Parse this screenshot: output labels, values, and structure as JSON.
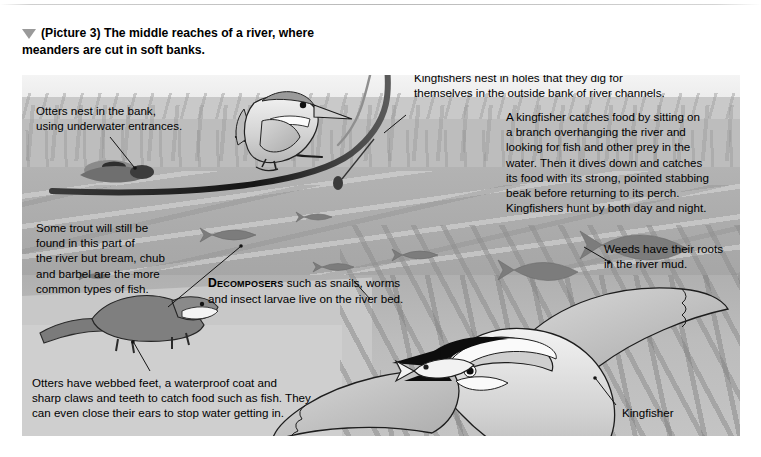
{
  "figure": {
    "caption": "(Picture 3) The middle reaches of a river, where meanders are cut in soft banks.",
    "caption_marker": "triangle-down-marker"
  },
  "annotations": [
    {
      "id": "otters-nest",
      "text": "Otters nest in the bank, using underwater entrances.",
      "lines": [
        "Otters nest in the bank,",
        "using underwater entrances."
      ]
    },
    {
      "id": "kingfishers-nest",
      "text": "Kingfishers nest in holes that they dig for themselves in the outside bank of river channels.",
      "lines": [
        "Kingfishers nest in holes that they dig for",
        "themselves in the outside bank of river channels."
      ]
    },
    {
      "id": "kingfisher-feeding",
      "text": "A kingfisher catches food by sitting on a branch overhanging the river and looking for fish and other prey in the water. Then it dives down and catches its food with its strong, pointed stabbing beak before returning to its perch. Kingfishers hunt by both day and night.",
      "lines": [
        "A kingfisher catches food by sitting on",
        "a branch overhanging the river and",
        "looking for fish and other prey in the",
        "water. Then it dives down and catches",
        "its food with its strong, pointed stabbing",
        "beak before returning to its perch.",
        "Kingfishers hunt by both day and night."
      ]
    },
    {
      "id": "fish-types",
      "text": "Some trout will still be found in this part of the river but bream, chub and barbel are the more common types of fish.",
      "lines": [
        "Some trout will still be",
        "found in this part of",
        "the river but bream, chub",
        "and barbel are the more",
        "common types of fish."
      ]
    },
    {
      "id": "decomposers",
      "lead_word": "Decomposers",
      "text": "Decomposers such as snails, worms and insect larvae live on the river bed.",
      "line1_rest": " such as snails, worms",
      "line2": "and insect larvae live on the river bed."
    },
    {
      "id": "weeds",
      "text": "Weeds have their roots in the river mud.",
      "lines": [
        "Weeds have their roots",
        "in the river mud."
      ]
    },
    {
      "id": "otter-features",
      "text": "Otters have webbed feet, a waterproof coat and sharp claws and teeth to catch food such as fish. They can even close their ears to stop water getting in.",
      "lines": [
        "Otters have webbed feet, a waterproof coat and",
        "sharp claws and teeth to catch food such as fish. They",
        "can even close their ears to stop water getting in."
      ]
    }
  ],
  "labels": [
    {
      "id": "kingfisher-label",
      "text": "Kingfisher"
    }
  ],
  "scene": {
    "elements": [
      "perched-kingfisher",
      "overhanging-branch",
      "flying-kingfisher-with-fish",
      "otter-on-bank",
      "otter-in-water",
      "fish-shoal",
      "river-water",
      "reed-bank",
      "weed-bed"
    ]
  },
  "colors": {
    "page_background": "#ffffff",
    "panel_background": "#d6d6d6",
    "water": "#a9a9a9",
    "bank": "#c4c4c4",
    "ink": "#111111",
    "bird_body": "#cfcfcf",
    "bird_dark": "#111111"
  }
}
